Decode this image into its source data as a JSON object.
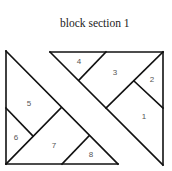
{
  "title": "block section 1",
  "pieces": [
    {
      "id": "piece-1",
      "label": "1"
    },
    {
      "id": "piece-2",
      "label": "2"
    },
    {
      "id": "piece-3",
      "label": "3"
    },
    {
      "id": "piece-4",
      "label": "4"
    },
    {
      "id": "piece-5",
      "label": "5"
    },
    {
      "id": "piece-6",
      "label": "6"
    },
    {
      "id": "piece-7",
      "label": "7"
    },
    {
      "id": "piece-8",
      "label": "8"
    }
  ]
}
